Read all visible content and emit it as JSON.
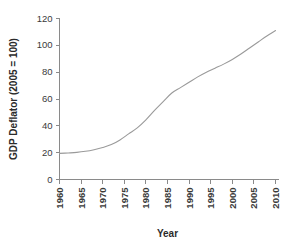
{
  "chart_data": {
    "type": "line",
    "title": "",
    "xlabel": "Year",
    "ylabel": "GDP Deflator (2005 = 100)",
    "xlim": [
      1960,
      2010
    ],
    "ylim": [
      0,
      120
    ],
    "grid": false,
    "legend": null,
    "xticks": [
      1960,
      1965,
      1970,
      1975,
      1980,
      1985,
      1990,
      1995,
      2000,
      2005,
      2010
    ],
    "xtick_labels": [
      "1960",
      "1965",
      "1970",
      "1975",
      "1980",
      "1985",
      "1990",
      "1995",
      "2000",
      "2005",
      "2010"
    ],
    "yticks": [
      0,
      20,
      40,
      60,
      80,
      100,
      120
    ],
    "ytick_labels": [
      "0",
      "20",
      "40",
      "60",
      "80",
      "100",
      "120"
    ],
    "x": [
      1960,
      1962,
      1964,
      1966,
      1968,
      1970,
      1972,
      1974,
      1976,
      1978,
      1980,
      1982,
      1984,
      1986,
      1988,
      1990,
      1992,
      1994,
      1996,
      1998,
      2000,
      2002,
      2004,
      2006,
      2008,
      2010
    ],
    "values": [
      19.5,
      19.8,
      20.2,
      21.0,
      22.2,
      23.8,
      26.0,
      29.5,
      34.0,
      38.5,
      44.5,
      51.5,
      58.0,
      64.5,
      68.5,
      72.5,
      76.5,
      80.0,
      83.0,
      86.0,
      89.5,
      93.5,
      98.0,
      102.5,
      107.0,
      111.0
    ],
    "series": [
      {
        "name": "GDP Deflator",
        "color": "#9a9a9a",
        "values": [
          19.5,
          19.8,
          20.2,
          21.0,
          22.2,
          23.8,
          26.0,
          29.5,
          34.0,
          38.5,
          44.5,
          51.5,
          58.0,
          64.5,
          68.5,
          72.5,
          76.5,
          80.0,
          83.0,
          86.0,
          89.5,
          93.5,
          98.0,
          102.5,
          107.0,
          111.0
        ]
      }
    ]
  },
  "colors": {
    "line": "#9a9a9a",
    "axis": "#8a8a8a",
    "text": "#2b2b2b",
    "background": "#ffffff"
  }
}
